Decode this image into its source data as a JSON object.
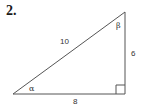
{
  "problem": {
    "number": "2."
  },
  "triangle": {
    "type": "right-triangle",
    "vertices": {
      "alpha_vertex": [
        13,
        94
      ],
      "right_angle_vertex": [
        125,
        94
      ],
      "beta_vertex": [
        125,
        12
      ]
    },
    "sides": {
      "hypotenuse": "10",
      "vertical_leg": "6",
      "horizontal_leg": "8"
    },
    "angles": {
      "alpha": "α",
      "beta": "β"
    },
    "stroke_color": "#555555"
  }
}
